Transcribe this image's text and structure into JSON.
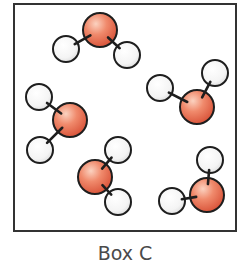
{
  "diagram": {
    "caption": "Box C",
    "box": {
      "x": 14,
      "y": 4,
      "width": 222,
      "height": 227,
      "stroke": "#333333",
      "stroke_width": 2
    },
    "colors": {
      "oxygen_highlight": "#fbd2c0",
      "oxygen_mid": "#f08a6c",
      "oxygen_edge": "#d9543a",
      "hydrogen_highlight": "#ffffff",
      "hydrogen_edge": "#dcdcdc",
      "outline": "#1e1e1e",
      "bond": "#1e1e1e"
    },
    "atom_radii": {
      "oxygen": 17,
      "hydrogen": 13
    },
    "molecules": [
      {
        "name": "water-molecule-1",
        "oxygen": [
          100,
          30
        ],
        "hydrogens": [
          [
            66,
            49
          ],
          [
            127,
            55
          ]
        ]
      },
      {
        "name": "water-molecule-2",
        "oxygen": [
          197,
          107
        ],
        "hydrogens": [
          [
            160,
            88
          ],
          [
            215,
            73
          ]
        ]
      },
      {
        "name": "water-molecule-3",
        "oxygen": [
          70,
          120
        ],
        "hydrogens": [
          [
            39,
            97
          ],
          [
            40,
            150
          ]
        ]
      },
      {
        "name": "water-molecule-4",
        "oxygen": [
          95,
          177
        ],
        "hydrogens": [
          [
            118,
            150
          ],
          [
            118,
            202
          ]
        ]
      },
      {
        "name": "water-molecule-5",
        "oxygen": [
          207,
          195
        ],
        "hydrogens": [
          [
            210,
            160
          ],
          [
            172,
            201
          ]
        ]
      }
    ]
  }
}
